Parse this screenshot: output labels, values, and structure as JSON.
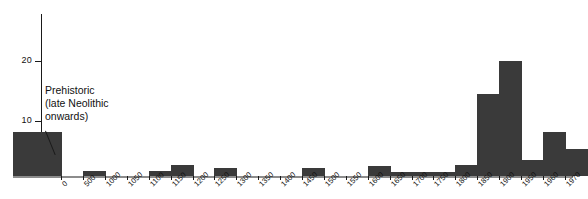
{
  "chart_data": {
    "type": "bar",
    "title": "",
    "subtitle": "",
    "xlabel": "",
    "ylabel": "",
    "ylim": [
      0,
      26
    ],
    "y_ticks": [
      10,
      20
    ],
    "grid": false,
    "legend": "none",
    "bar_color": "#3a3a3a",
    "axis_color": "#1a1a1a",
    "categories": [
      "Prehistoric",
      "0",
      "500",
      "1000",
      "1050",
      "1100",
      "1150",
      "1200",
      "1250",
      "1300",
      "1350",
      "1400",
      "1450",
      "1500",
      "1550",
      "1600",
      "1650",
      "1700",
      "1750",
      "1800",
      "1850",
      "1900",
      "1950",
      "1960",
      "1970"
    ],
    "x_tick_labels": [
      "0",
      "500",
      "1000",
      "1050",
      "1100",
      "1150",
      "1200",
      "1250",
      "1300",
      "1350",
      "1400",
      "1450",
      "1500",
      "1550",
      "1600",
      "1650",
      "1700",
      "1750",
      "1800",
      "1850",
      "1900",
      "1950",
      "1960",
      "1970"
    ],
    "bins": [
      {
        "label": "Prehistoric",
        "from": "prehistoric",
        "to": "0",
        "value": 8,
        "width_units": 2.2
      },
      {
        "label": "0-500",
        "from": "0",
        "to": "500",
        "value": 0,
        "width_units": 1
      },
      {
        "label": "500-1000",
        "from": "500",
        "to": "1000",
        "value": 1,
        "width_units": 1
      },
      {
        "label": "1000-1050",
        "from": "1000",
        "to": "1050",
        "value": 0,
        "width_units": 1
      },
      {
        "label": "1050-1100",
        "from": "1050",
        "to": "1100",
        "value": 0,
        "width_units": 1
      },
      {
        "label": "1100-1150",
        "from": "1100",
        "to": "1150",
        "value": 1,
        "width_units": 1
      },
      {
        "label": "1150-1200",
        "from": "1150",
        "to": "1200",
        "value": 2,
        "width_units": 1
      },
      {
        "label": "1200-1250",
        "from": "1200",
        "to": "1250",
        "value": 0,
        "width_units": 1
      },
      {
        "label": "1250-1300",
        "from": "1250",
        "to": "1300",
        "value": 1.5,
        "width_units": 1
      },
      {
        "label": "1300-1350",
        "from": "1300",
        "to": "1350",
        "value": 0,
        "width_units": 1
      },
      {
        "label": "1350-1400",
        "from": "1350",
        "to": "1400",
        "value": 0,
        "width_units": 1
      },
      {
        "label": "1400-1450",
        "from": "1400",
        "to": "1450",
        "value": 0,
        "width_units": 1
      },
      {
        "label": "1450-1500",
        "from": "1450",
        "to": "1500",
        "value": 1.5,
        "width_units": 1
      },
      {
        "label": "1500-1550",
        "from": "1500",
        "to": "1550",
        "value": 0,
        "width_units": 1
      },
      {
        "label": "1550-1600",
        "from": "1550",
        "to": "1600",
        "value": 0,
        "width_units": 1
      },
      {
        "label": "1600-1650",
        "from": "1600",
        "to": "1650",
        "value": 1.8,
        "width_units": 1
      },
      {
        "label": "1650-1700",
        "from": "1650",
        "to": "1700",
        "value": 0.7,
        "width_units": 1
      },
      {
        "label": "1700-1750",
        "from": "1700",
        "to": "1750",
        "value": 0.7,
        "width_units": 1
      },
      {
        "label": "1750-1800",
        "from": "1750",
        "to": "1800",
        "value": 0.7,
        "width_units": 1
      },
      {
        "label": "1800-1850",
        "from": "1800",
        "to": "1850",
        "value": 2,
        "width_units": 1
      },
      {
        "label": "1850-1900",
        "from": "1850",
        "to": "1900",
        "value": 15,
        "width_units": 1
      },
      {
        "label": "1900-1950",
        "from": "1900",
        "to": "1950",
        "value": 21,
        "width_units": 1
      },
      {
        "label": "1950-1960",
        "from": "1950",
        "to": "1960",
        "value": 3,
        "width_units": 1
      },
      {
        "label": "1960-1970",
        "from": "1960",
        "to": "1970",
        "value": 8,
        "width_units": 1
      },
      {
        "label": "1970+",
        "from": "1970",
        "to": "",
        "value": 5,
        "width_units": 1
      }
    ],
    "annotations": [
      {
        "name": "prehistoric-annotation",
        "lines": [
          "Prehistoric",
          "(late Neolithic",
          "onwards)"
        ],
        "target_bin": "Prehistoric"
      }
    ]
  },
  "annotation": {
    "line1": "Prehistoric",
    "line2": "(late Neolithic",
    "line3": "onwards)"
  }
}
